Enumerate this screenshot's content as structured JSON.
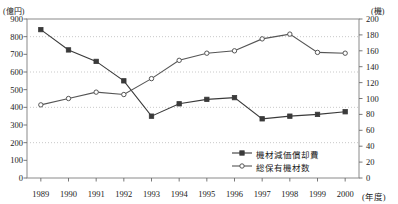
{
  "chart_data": {
    "type": "line",
    "title": "",
    "xlabel": "(年度)",
    "categories": [
      "1989",
      "1990",
      "1991",
      "1992",
      "1993",
      "1994",
      "1995",
      "1996",
      "1997",
      "1998",
      "1999",
      "2000"
    ],
    "grid": true,
    "legend_position": "bottom-right",
    "axes": {
      "left": {
        "unit": "(億円)",
        "ylim": [
          0,
          900
        ],
        "ticks": [
          0,
          100,
          200,
          300,
          400,
          500,
          600,
          700,
          800,
          900
        ],
        "tick_labels": [
          "0",
          "100",
          "200",
          "300",
          "400",
          "500",
          "600",
          "700",
          "800",
          "900"
        ]
      },
      "right": {
        "unit": "(機)",
        "ylim": [
          0,
          200
        ],
        "ticks": [
          0,
          20,
          40,
          60,
          80,
          100,
          120,
          140,
          160,
          180,
          200
        ],
        "tick_labels": [
          "0",
          "20",
          "40",
          "60",
          "80",
          "100",
          "120",
          "140",
          "160",
          "180",
          "200"
        ]
      }
    },
    "series": [
      {
        "name": "機材減価償却費",
        "axis": "left",
        "marker": "filled-square",
        "color": "#3a3a3a",
        "values": [
          840,
          725,
          660,
          550,
          350,
          420,
          445,
          455,
          335,
          350,
          360,
          375
        ]
      },
      {
        "name": "総保有機材数",
        "axis": "right",
        "marker": "open-circle",
        "color": "#555555",
        "values": [
          92,
          100,
          108,
          105,
          125,
          148,
          157,
          160,
          175,
          181,
          158,
          157
        ]
      }
    ]
  },
  "legend": {
    "items": [
      {
        "label": "機材減価償却費",
        "marker": "filled-square"
      },
      {
        "label": "総保有機材数",
        "marker": "open-circle"
      }
    ]
  }
}
